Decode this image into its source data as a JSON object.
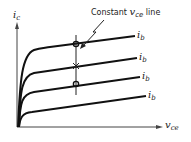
{
  "diagram": {
    "y_axis": {
      "symbol": "i",
      "subscript": "c"
    },
    "x_axis": {
      "symbol": "v",
      "subscript": "ce"
    },
    "annotation": {
      "prefix": "Constant ",
      "symbol": "v",
      "subscript": "ce",
      "suffix": " line"
    },
    "curves": [
      {
        "symbol": "i",
        "subscript": "b"
      },
      {
        "symbol": "i",
        "subscript": "b"
      },
      {
        "symbol": "i",
        "subscript": "b"
      },
      {
        "symbol": "i",
        "subscript": "b"
      }
    ],
    "markers": [
      "circle",
      "cross",
      "circle"
    ]
  }
}
